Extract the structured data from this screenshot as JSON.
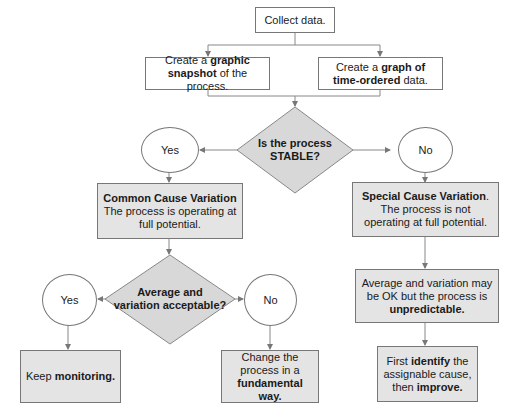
{
  "flowchart": {
    "start": {
      "text": "Collect data."
    },
    "snapshot": {
      "pre": "Create a ",
      "bold": "graphic snapshot",
      "post": " of the process."
    },
    "timeordered": {
      "pre": "Create a ",
      "bold": "graph of time-ordered",
      "post": " data."
    },
    "decision1": {
      "line1": "Is the process",
      "line2": "STABLE?"
    },
    "yes1": {
      "label": "Yes"
    },
    "no1": {
      "label": "No"
    },
    "common": {
      "title": "Common Cause Variation",
      "text": "The process is operating at full potential."
    },
    "special": {
      "title": "Special Cause Variation",
      "title_suffix": ".",
      "text": "The process is not operating at full potential."
    },
    "decision2": {
      "line1": "Average and",
      "line2": "variation acceptable?"
    },
    "yes2": {
      "label": "Yes"
    },
    "no2": {
      "label": "No"
    },
    "keep": {
      "pre": "Keep ",
      "bold": "monitoring."
    },
    "change": {
      "pre": "Change the process in a ",
      "bold": "fundamental way."
    },
    "unpredictable": {
      "pre": "Average and variation may be OK but the process is ",
      "bold": "unpredictable."
    },
    "identify": {
      "pre1": "First ",
      "bold1": "identify",
      "mid": " the assignable cause, then ",
      "bold2": "improve."
    }
  }
}
